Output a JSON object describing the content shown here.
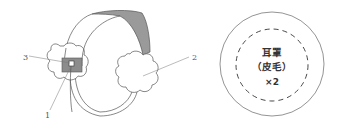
{
  "figure": {
    "device": {
      "name": "earmuff-headset",
      "callouts": [
        {
          "id": "1",
          "label": "1"
        },
        {
          "id": "2",
          "label": "2"
        },
        {
          "id": "3",
          "label": "3"
        }
      ]
    },
    "legend_circle": {
      "line1": "耳罩",
      "line2": "（皮毛）",
      "line3": "×2"
    },
    "colors": {
      "stroke": "#555555",
      "band_fill": "#9a9a9a",
      "box_fill": "#8c8c8c",
      "background": "#ffffff"
    }
  }
}
